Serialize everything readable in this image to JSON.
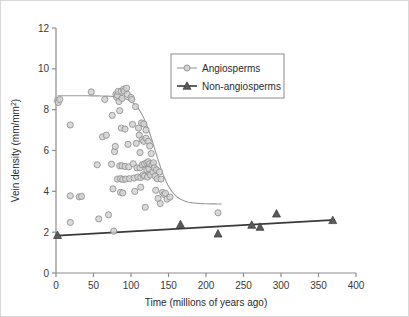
{
  "figure": {
    "background_color": "#ffffff",
    "border_color": "#d9d9d9"
  },
  "chart_data": {
    "type": "scatter",
    "title": "",
    "subtitle": "",
    "xlabel": "Time (millions of years ago)",
    "ylabel": "Vein density (mm/mm2)",
    "ylabel_base": "Vein density (mm/mm",
    "ylabel_sup": "2",
    "ylabel_close": ")",
    "xlim": [
      0,
      400
    ],
    "ylim": [
      0,
      12
    ],
    "xticks": [
      0,
      50,
      100,
      150,
      200,
      250,
      300,
      350,
      400
    ],
    "xtick_labels": [
      "0",
      "50",
      "100",
      "150",
      "200",
      "250",
      "300",
      "350",
      "400"
    ],
    "yticks": [
      0,
      2,
      4,
      6,
      8,
      10,
      12
    ],
    "ytick_labels": [
      "0",
      "2",
      "4",
      "6",
      "8",
      "10",
      "12"
    ],
    "grid": false,
    "legend_position": "upper-center",
    "series": [
      {
        "name": "Angiosperms",
        "marker": "circle",
        "marker_fill": "#d2d2d2",
        "marker_edge": "#8a8a8a",
        "line_color": "#9a9a9a",
        "points": [
          [
            2,
            8.45
          ],
          [
            3,
            8.35
          ],
          [
            5,
            8.5
          ],
          [
            19,
            7.25
          ],
          [
            19,
            3.78
          ],
          [
            19,
            2.48
          ],
          [
            31,
            3.73
          ],
          [
            34,
            3.75
          ],
          [
            47,
            8.87
          ],
          [
            55,
            5.3
          ],
          [
            57,
            2.65
          ],
          [
            62,
            6.67
          ],
          [
            65,
            8.5
          ],
          [
            67,
            6.75
          ],
          [
            70,
            2.85
          ],
          [
            74,
            5.33
          ],
          [
            75,
            7.72
          ],
          [
            76,
            4.12
          ],
          [
            77,
            2.05
          ],
          [
            78,
            5.95
          ],
          [
            79,
            6.2
          ],
          [
            80,
            8.75
          ],
          [
            81,
            8.6
          ],
          [
            82,
            8.7
          ],
          [
            82,
            4.6
          ],
          [
            83,
            8.9
          ],
          [
            84,
            8.4
          ],
          [
            85,
            7.95
          ],
          [
            85,
            5.25
          ],
          [
            86,
            4.62
          ],
          [
            86,
            3.95
          ],
          [
            87,
            8.9
          ],
          [
            87,
            7.1
          ],
          [
            88,
            8.55
          ],
          [
            88,
            5.25
          ],
          [
            89,
            4.58
          ],
          [
            89,
            3.92
          ],
          [
            90,
            9.0
          ],
          [
            91,
            8.9
          ],
          [
            92,
            7.05
          ],
          [
            92,
            5.22
          ],
          [
            93,
            4.6
          ],
          [
            94,
            9.05
          ],
          [
            95,
            8.75
          ],
          [
            96,
            6.3
          ],
          [
            97,
            5.2
          ],
          [
            98,
            4.62
          ],
          [
            100,
            8.6
          ],
          [
            101,
            8.5
          ],
          [
            102,
            7.28
          ],
          [
            103,
            5.35
          ],
          [
            104,
            4.65
          ],
          [
            105,
            4.0
          ],
          [
            106,
            8.15
          ],
          [
            107,
            6.35
          ],
          [
            108,
            5.15
          ],
          [
            109,
            4.7
          ],
          [
            110,
            7.1
          ],
          [
            111,
            6.75
          ],
          [
            112,
            5.9
          ],
          [
            112,
            5.15
          ],
          [
            113,
            4.68
          ],
          [
            113,
            4.2
          ],
          [
            114,
            7.35
          ],
          [
            115,
            6.52
          ],
          [
            115,
            5.3
          ],
          [
            116,
            4.8
          ],
          [
            117,
            7.3
          ],
          [
            117,
            6.45
          ],
          [
            118,
            5.35
          ],
          [
            118,
            4.75
          ],
          [
            119,
            3.22
          ],
          [
            120,
            7.0
          ],
          [
            120,
            6.6
          ],
          [
            121,
            5.4
          ],
          [
            121,
            5.05
          ],
          [
            122,
            4.7
          ],
          [
            123,
            6.45
          ],
          [
            123,
            5.45
          ],
          [
            124,
            5.1
          ],
          [
            125,
            6.22
          ],
          [
            125,
            5.35
          ],
          [
            126,
            4.8
          ],
          [
            127,
            5.85
          ],
          [
            128,
            5.3
          ],
          [
            129,
            4.95
          ],
          [
            130,
            5.4
          ],
          [
            131,
            5.15
          ],
          [
            132,
            4.75
          ],
          [
            133,
            4.05
          ],
          [
            134,
            5.05
          ],
          [
            135,
            4.62
          ],
          [
            136,
            3.65
          ],
          [
            138,
            4.95
          ],
          [
            139,
            3.4
          ],
          [
            140,
            4.6
          ],
          [
            142,
            3.95
          ],
          [
            144,
            3.85
          ],
          [
            146,
            3.9
          ],
          [
            148,
            3.62
          ],
          [
            152,
            3.72
          ],
          [
            216,
            2.95
          ]
        ],
        "fitted_curve": {
          "description": "logistic decline",
          "left_plateau": 8.68,
          "right_plateau": 3.38,
          "midpoint_x": 132,
          "steepness": 0.09,
          "x_start": 2,
          "x_end": 222
        }
      },
      {
        "name": "Non-angiosperms",
        "marker": "triangle",
        "marker_fill": "#5a5a5a",
        "marker_edge": "#3a3a3a",
        "line_color": "#3a3a3a",
        "points": [
          [
            2,
            1.85
          ],
          [
            166,
            2.38
          ],
          [
            216,
            1.92
          ],
          [
            261,
            2.35
          ],
          [
            272,
            2.25
          ],
          [
            294,
            2.9
          ],
          [
            369,
            2.58
          ]
        ],
        "fitted_curve": {
          "description": "linear trend",
          "x_start": 2,
          "y_start": 1.83,
          "x_end": 372,
          "y_end": 2.6
        }
      }
    ],
    "legend": {
      "entries": [
        {
          "label": "Angiosperms",
          "marker": "circle"
        },
        {
          "label": "Non-angiosperms",
          "marker": "triangle"
        }
      ]
    }
  }
}
